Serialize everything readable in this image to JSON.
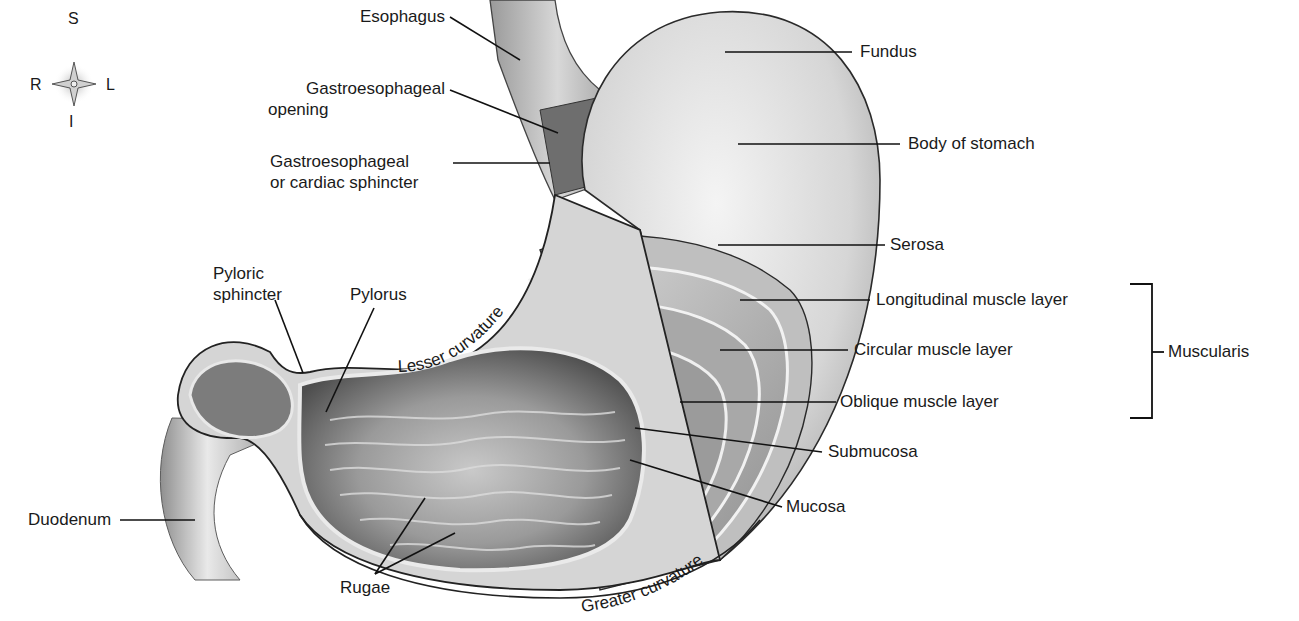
{
  "figure": {
    "compass": {
      "top": "S",
      "bottom": "I",
      "left": "R",
      "right": "L"
    },
    "labels": {
      "esophagus": "Esophagus",
      "ge_opening_line1": "Gastroesophageal",
      "ge_opening_line2": "opening",
      "ge_sphincter_line1": "Gastroesophageal",
      "ge_sphincter_line2": "or cardiac sphincter",
      "fundus": "Fundus",
      "body": "Body of stomach",
      "serosa": "Serosa",
      "longitudinal": "Longitudinal muscle layer",
      "circular": "Circular muscle layer",
      "oblique": "Oblique muscle layer",
      "muscularis": "Muscularis",
      "submucosa": "Submucosa",
      "mucosa": "Mucosa",
      "pyloric_sphincter_line1": "Pyloric",
      "pyloric_sphincter_line2": "sphincter",
      "pylorus": "Pylorus",
      "lesser_curvature": "Lesser curvature",
      "greater_curvature": "Greater curvature",
      "duodenum": "Duodenum",
      "rugae": "Rugae"
    },
    "colors": {
      "ink": "#1a1a1a",
      "tissue_light": "#e6e6e6",
      "tissue_mid": "#bdbdbd",
      "tissue_dark": "#7a7a7a",
      "lumen": "#5e5e5e"
    }
  }
}
